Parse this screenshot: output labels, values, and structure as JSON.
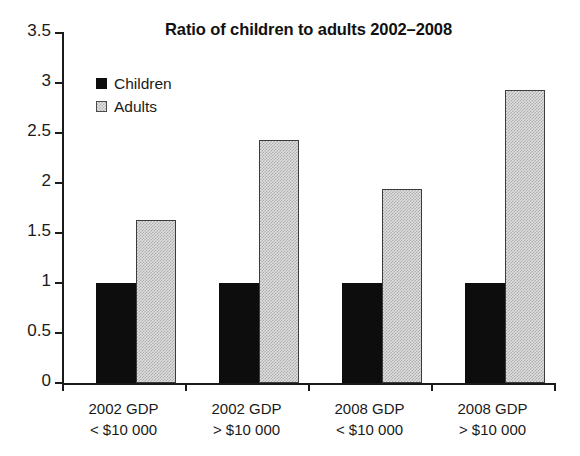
{
  "chart_data": {
    "type": "bar",
    "title": "Ratio of children to adults 2002–2008",
    "xlabel": "",
    "ylabel": "",
    "ylim": [
      0,
      3.5
    ],
    "yticks": [
      "0",
      "0.5",
      "1",
      "1.5",
      "2",
      "2.5",
      "3",
      "3.5"
    ],
    "ytick_values": [
      0,
      0.5,
      1,
      1.5,
      2,
      2.5,
      3,
      3.5
    ],
    "grid": false,
    "legend_position": "top-left inside plot",
    "categories": [
      {
        "line1": "2002 GDP",
        "line2": "< $10 000"
      },
      {
        "line1": "2002 GDP",
        "line2": "> $10 000"
      },
      {
        "line1": "2008 GDP",
        "line2": "< $10 000"
      },
      {
        "line1": "2008 GDP",
        "line2": "> $10 000"
      }
    ],
    "series": [
      {
        "name": "Children",
        "color": "#0d0d0d",
        "values": [
          1.0,
          1.0,
          1.0,
          1.0
        ]
      },
      {
        "name": "Adults",
        "color": "#dedede",
        "values": [
          1.63,
          2.42,
          1.93,
          2.92
        ]
      }
    ]
  }
}
